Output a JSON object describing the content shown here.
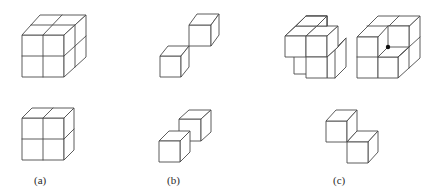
{
  "figure": {
    "type": "cube-decomposition-diagram",
    "panels": [
      {
        "id": "a",
        "label": "(a)",
        "top_shape": "2x2x2 cube",
        "bottom_shape": "2x2x1 slab (one layer of cubes)"
      },
      {
        "id": "b",
        "label": "(b)",
        "top_shape": "two unit cubes joined diagonally at a single corner",
        "bottom_shape": "two unit cubes joined diagonally along an edge"
      },
      {
        "id": "c",
        "label": "(c)",
        "top_shapes": [
          "2x2x2 cube with missing pieces (partial)",
          "2x2x2 cube with front-top-right cube removed, interior corner marked with dot"
        ],
        "bottom_shape": "two unit cubes sharing an edge (diagonal arrangement)"
      }
    ],
    "colors": {
      "stroke": "#4a4a4a",
      "background": "#ffffff",
      "dot": "#111111"
    }
  }
}
